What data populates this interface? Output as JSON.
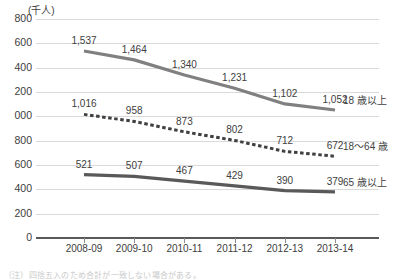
{
  "chart_data": {
    "type": "line",
    "title": "",
    "unit_label": "(千人)",
    "xlabel": "",
    "ylabel": "",
    "ylim": [
      0,
      1800
    ],
    "ytick_values": [
      1800,
      1600,
      1400,
      1200,
      1000,
      800,
      600,
      400,
      200,
      0
    ],
    "ytick_labels": [
      "800",
      "600",
      "400",
      "200",
      "000",
      "800",
      "600",
      "400",
      "200",
      "0"
    ],
    "grid": true,
    "legend_position": "right-inline",
    "categories": [
      "2008-09",
      "2009-10",
      "2010-11",
      "2011-12",
      "2012-13",
      "2013-14"
    ],
    "series": [
      {
        "name": "18 歳以上",
        "style": "solid",
        "color": "#808080",
        "values": [
          1537,
          1464,
          1340,
          1231,
          1102,
          1052
        ],
        "labels": [
          "1,537",
          "1,464",
          "1,340",
          "1,231",
          "1,102",
          "1,052"
        ]
      },
      {
        "name": "18～64 歳",
        "style": "dashed",
        "color": "#404040",
        "values": [
          1016,
          958,
          873,
          802,
          712,
          672
        ],
        "labels": [
          "1,016",
          "958",
          "873",
          "802",
          "712",
          "672"
        ]
      },
      {
        "name": "65 歳以上",
        "style": "solid",
        "color": "#595959",
        "values": [
          521,
          507,
          467,
          429,
          390,
          379
        ],
        "labels": [
          "521",
          "507",
          "467",
          "429",
          "390",
          "379"
        ]
      }
    ]
  },
  "footer": {
    "note": "（注）四捨五入のため合計が一致しない場合がある。"
  }
}
